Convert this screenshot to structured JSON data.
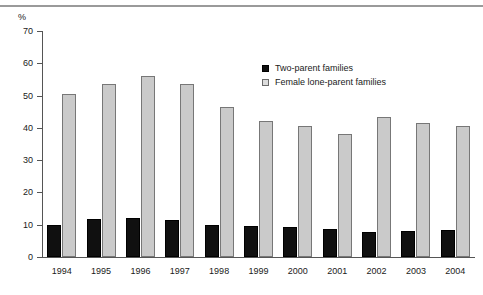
{
  "chart_data": {
    "type": "bar",
    "title": "",
    "xlabel": "",
    "ylabel": "%",
    "unit_label": "%",
    "ylim": [
      0,
      70
    ],
    "ytick_step": 10,
    "yticks": [
      70,
      60,
      50,
      40,
      30,
      20,
      10,
      0
    ],
    "grid": false,
    "legend_position": "upper-center-right",
    "categories": [
      "1994",
      "1995",
      "1996",
      "1997",
      "1998",
      "1999",
      "2000",
      "2001",
      "2002",
      "2003",
      "2004"
    ],
    "series": [
      {
        "name": "Two-parent families",
        "color": "#101010",
        "values": [
          10.0,
          11.7,
          12.2,
          11.5,
          10.0,
          9.5,
          9.4,
          8.7,
          7.8,
          8.2,
          8.5
        ]
      },
      {
        "name": "Female lone-parent families",
        "color": "#cacaca",
        "values": [
          50.5,
          53.5,
          56.0,
          53.5,
          46.5,
          42.0,
          40.5,
          38.0,
          43.3,
          41.5,
          40.5
        ]
      }
    ]
  },
  "axis": {
    "unit": "%",
    "tick_labels": [
      "70",
      "60",
      "50",
      "40",
      "30",
      "20",
      "10",
      "0"
    ],
    "x_labels": [
      "1994",
      "1995",
      "1996",
      "1997",
      "1998",
      "1999",
      "2000",
      "2001",
      "2002",
      "2003",
      "2004"
    ]
  },
  "legend": {
    "items": [
      {
        "label": "Two-parent families",
        "swatch": "dark"
      },
      {
        "label": "Female lone-parent families",
        "swatch": "light"
      }
    ]
  }
}
